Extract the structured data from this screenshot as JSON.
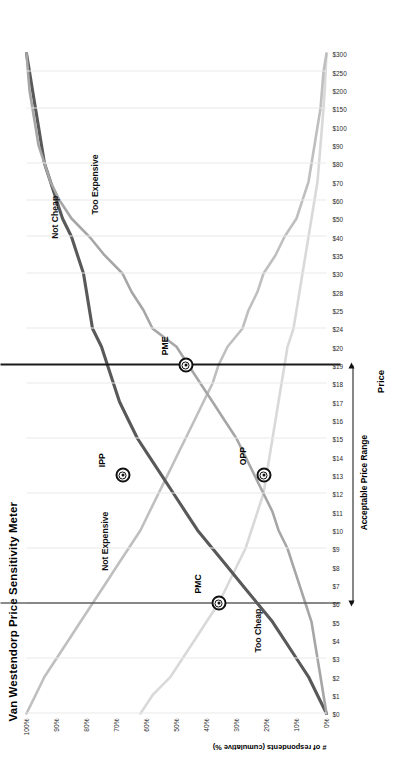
{
  "chart_data": {
    "type": "line",
    "title": "Van Westendorp Price Sensitivity Meter",
    "xlabel": "Price",
    "ylabel": "# of respondents (cumulative %)",
    "orientation": "rotated-90ccw",
    "grid": true,
    "legend": "inline-curve-labels",
    "x": [
      "$0",
      "$1",
      "$2",
      "$3",
      "$4",
      "$5",
      "$6",
      "$7",
      "$8",
      "$9",
      "$10",
      "$11",
      "$12",
      "$13",
      "$14",
      "$15",
      "$16",
      "$17",
      "$18",
      "$19",
      "$20",
      "$24",
      "$25",
      "$28",
      "$30",
      "$35",
      "$40",
      "$50",
      "$60",
      "$70",
      "$80",
      "$90",
      "$100",
      "$150",
      "$200",
      "$250",
      "$300"
    ],
    "ytick_labels": [
      "0%",
      "10%",
      "20%",
      "30%",
      "40%",
      "50%",
      "60%",
      "70%",
      "80%",
      "90%",
      "100%"
    ],
    "ylim": [
      0,
      100
    ],
    "series": [
      {
        "name": "Too Cheap",
        "color": "#d9d9d9",
        "values": [
          62,
          58,
          52,
          48,
          44,
          40,
          36,
          33,
          30,
          27,
          25,
          23,
          21,
          20,
          19,
          18,
          17,
          16,
          15,
          14,
          13,
          11,
          10,
          9,
          8,
          7,
          6,
          5,
          4,
          3,
          2.5,
          2,
          1.5,
          1,
          0.6,
          0.3,
          0
        ]
      },
      {
        "name": "Not Expensive",
        "color": "#bfbfbf",
        "values": [
          100,
          97,
          94,
          90,
          86,
          82,
          78,
          74,
          70,
          66,
          62,
          59,
          56,
          53,
          50,
          47,
          44,
          41,
          38,
          36,
          33,
          28,
          26,
          23,
          21,
          17,
          14,
          10,
          8,
          6,
          5,
          4,
          3,
          2,
          1.5,
          1,
          0
        ]
      },
      {
        "name": "Not Cheap",
        "color": "#595959",
        "values": [
          0,
          3,
          6,
          10,
          14,
          18,
          23,
          28,
          33,
          38,
          43,
          47,
          51,
          55,
          59,
          63,
          66,
          69,
          71,
          73,
          75,
          78,
          79,
          80,
          81,
          83,
          85,
          88,
          90,
          92,
          94,
          95,
          96,
          97,
          98,
          99,
          100
        ]
      },
      {
        "name": "Too Expensive",
        "color": "#a6a6a6",
        "values": [
          0,
          1,
          2,
          3,
          4,
          5,
          7,
          9,
          11,
          13,
          16,
          18,
          21,
          24,
          27,
          30,
          34,
          38,
          42,
          46,
          50,
          58,
          61,
          65,
          68,
          74,
          79,
          85,
          89,
          92,
          94,
          96,
          97,
          98,
          99,
          99.5,
          100
        ]
      }
    ],
    "intersections": [
      {
        "name": "PMC",
        "label": "PMC",
        "price": "$6",
        "percent": "36%",
        "description": "Point of Marginal Cheapness"
      },
      {
        "name": "OPP",
        "label": "OPP",
        "price": "$13",
        "percent": "21%",
        "description": "Optimal Price Point"
      },
      {
        "name": "IPP",
        "label": "IPP",
        "price": "$13",
        "percent": "68%",
        "description": "Indifference Price Point"
      },
      {
        "name": "PME",
        "label": "PME",
        "price": "$19",
        "percent": "47%",
        "description": "Point of Marginal Expensiveness"
      }
    ],
    "annotations": [
      {
        "name": "acceptable-price-range",
        "text": "Acceptable Price Range",
        "from": "$6",
        "to": "$19"
      }
    ],
    "reference_lines": [
      {
        "name": "pmc-reference-line",
        "at": "$6"
      },
      {
        "name": "pme-reference-line",
        "at": "$19"
      }
    ]
  },
  "colors": {
    "too_cheap": "#d9d9d9",
    "not_expensive": "#bfbfbf",
    "not_cheap": "#595959",
    "too_expensive": "#a6a6a6",
    "grid": "#e9e9e9",
    "axis_text": "#2b2b2b",
    "reference_line": "#1a1a1a"
  }
}
